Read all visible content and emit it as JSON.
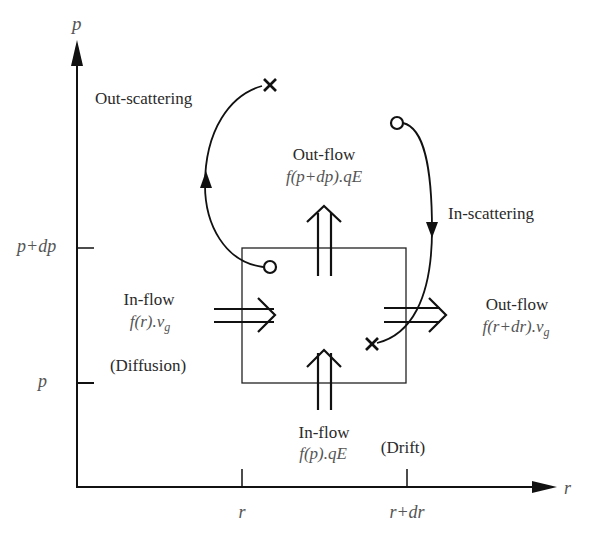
{
  "axes": {
    "y_label": "p",
    "x_label": "r",
    "y_ticks": [
      "p+dp",
      "p"
    ],
    "x_ticks": [
      "r",
      "r+dr"
    ]
  },
  "flows": {
    "out_scattering": {
      "label": "Out-scattering"
    },
    "in_scattering": {
      "label": "In-scattering"
    },
    "top_outflow": {
      "title": "Out-flow",
      "formula": "f(p+dp).qE"
    },
    "left_inflow": {
      "title": "In-flow",
      "formula": "f(r).v",
      "subscript": "g",
      "note": "(Diffusion)"
    },
    "right_outflow": {
      "title": "Out-flow",
      "formula": "f(r+dr).v",
      "subscript": "g"
    },
    "bottom_inflow": {
      "title": "In-flow",
      "formula": "f(p).qE",
      "note": "(Drift)"
    }
  },
  "colors": {
    "line": "#111111",
    "text": "#2a2a2a",
    "math_text": "#555555",
    "background": "#ffffff"
  }
}
